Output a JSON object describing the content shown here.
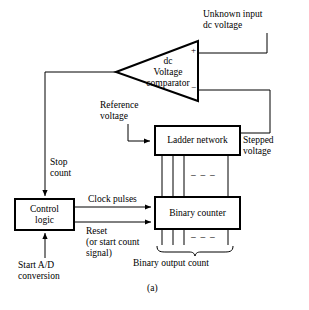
{
  "figure": {
    "caption": "(a)",
    "line_color": "#000000",
    "background": "#ffffff"
  },
  "blocks": {
    "comparator": {
      "label": "dc\nVoltage\ncomparator",
      "plus": "+",
      "minus": "−"
    },
    "ladder": {
      "label": "Ladder network"
    },
    "control": {
      "label": "Control\nlogic"
    },
    "counter": {
      "label": "Binary counter"
    }
  },
  "labels": {
    "unknown_input": "Unknown input\ndc voltage",
    "reference_voltage": "Reference\nvoltage",
    "stepped_voltage": "Stepped\nvoltage",
    "stop_count": "Stop\ncount",
    "clock_pulses": "Clock pulses",
    "reset": "Reset\n(or start count\nsignal)",
    "start_ad": "Start A/D\nconversion",
    "binary_output_count": "Binary output count",
    "ellipsis_top": "–  –  –",
    "ellipsis_bottom": "–  –  –"
  }
}
